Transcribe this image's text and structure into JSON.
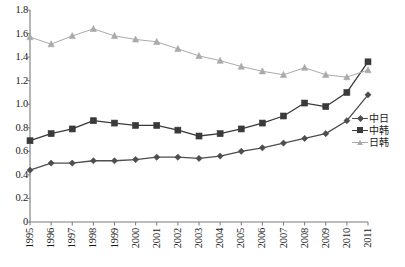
{
  "chart_data": {
    "type": "line",
    "title": "",
    "subtitle": "",
    "xlabel": "",
    "ylabel": "",
    "grid": false,
    "legend_position": "right",
    "xlim": [
      1995,
      2011
    ],
    "ylim": [
      0,
      1.8
    ],
    "ytick_step": 0.2,
    "categories": [
      "1995",
      "1996",
      "1997",
      "1998",
      "1999",
      "2000",
      "2001",
      "2002",
      "2003",
      "2004",
      "2005",
      "2006",
      "2007",
      "2008",
      "2009",
      "2010",
      "2011"
    ],
    "x": [
      1995,
      1996,
      1997,
      1998,
      1999,
      2000,
      2001,
      2002,
      2003,
      2004,
      2005,
      2006,
      2007,
      2008,
      2009,
      2010,
      2011
    ],
    "ytick_labels": [
      "0",
      "0.2",
      "0.4",
      "0.6",
      "0.8",
      "1.0",
      "1.2",
      "1.4",
      "1.6",
      "1.8"
    ],
    "ytick_values": [
      0,
      0.2,
      0.4,
      0.6,
      0.8,
      1.0,
      1.2,
      1.4,
      1.6,
      1.8
    ],
    "series": [
      {
        "name": "中日",
        "marker": "diamond",
        "color": "#4d4d4d",
        "values": [
          0.44,
          0.5,
          0.5,
          0.52,
          0.52,
          0.53,
          0.55,
          0.55,
          0.54,
          0.56,
          0.6,
          0.63,
          0.67,
          0.71,
          0.75,
          0.86,
          1.08
        ]
      },
      {
        "name": "中韩",
        "marker": "square",
        "color": "#3a3a3a",
        "values": [
          0.69,
          0.75,
          0.79,
          0.86,
          0.84,
          0.82,
          0.82,
          0.78,
          0.73,
          0.75,
          0.79,
          0.84,
          0.9,
          1.01,
          0.98,
          1.1,
          1.36
        ]
      },
      {
        "name": "日韩",
        "marker": "triangle",
        "color": "#aaaaaa",
        "values": [
          1.57,
          1.51,
          1.58,
          1.64,
          1.58,
          1.55,
          1.53,
          1.47,
          1.41,
          1.37,
          1.32,
          1.28,
          1.25,
          1.31,
          1.25,
          1.23,
          1.29
        ]
      }
    ]
  },
  "axes": {
    "axis_color": "#7a7a7a",
    "tick_color": "#7a7a7a"
  }
}
